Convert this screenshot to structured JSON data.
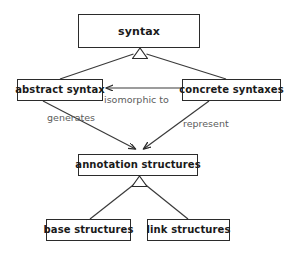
{
  "diagram": {
    "type": "uml-class-diagram",
    "canvas": {
      "width": 291,
      "height": 255,
      "background": "#ffffff"
    },
    "colors": {
      "node_border": "#2b2b2b",
      "node_fill": "#ffffff",
      "node_text": "#1a1a1a",
      "edge_line": "#3a3a3a",
      "edge_label_text": "#5c5c5c"
    },
    "nodes": [
      {
        "id": "syntax",
        "label": "syntax"
      },
      {
        "id": "abstract_syntax",
        "label": "abstract syntax"
      },
      {
        "id": "concrete_syntaxes",
        "label": "concrete syntaxes"
      },
      {
        "id": "annotation_structures",
        "label": "annotation structures"
      },
      {
        "id": "base_structures",
        "label": "base structures"
      },
      {
        "id": "link_structures",
        "label": "link structures"
      }
    ],
    "edges": [
      {
        "id": "e1",
        "from": "abstract_syntax",
        "to": "syntax",
        "kind": "generalization",
        "marker": "hollow-triangle",
        "label": ""
      },
      {
        "id": "e2",
        "from": "concrete_syntaxes",
        "to": "syntax",
        "kind": "generalization",
        "marker": "hollow-triangle",
        "label": ""
      },
      {
        "id": "e3",
        "from": "concrete_syntaxes",
        "to": "abstract_syntax",
        "kind": "association",
        "marker": "open-arrow",
        "label": "isomorphic to"
      },
      {
        "id": "e4",
        "from": "abstract_syntax",
        "to": "annotation_structures",
        "kind": "association",
        "marker": "open-arrow",
        "label": "generates"
      },
      {
        "id": "e5",
        "from": "concrete_syntaxes",
        "to": "annotation_structures",
        "kind": "association",
        "marker": "open-arrow",
        "label": "represent"
      },
      {
        "id": "e6",
        "from": "base_structures",
        "to": "annotation_structures",
        "kind": "generalization",
        "marker": "hollow-triangle",
        "label": ""
      },
      {
        "id": "e7",
        "from": "link_structures",
        "to": "annotation_structures",
        "kind": "generalization",
        "marker": "hollow-triangle",
        "label": ""
      }
    ],
    "edge_labels": {
      "isomorphic_to": "isomorphic to",
      "generates": "generates",
      "represent": "represent"
    }
  }
}
